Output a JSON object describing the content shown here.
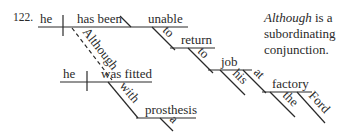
{
  "diagram": {
    "number": "122.",
    "main_clause": {
      "subject": "he",
      "verb": "has been",
      "complement": "unable",
      "infinitive_to_1": "to",
      "infinitive_verb": "return",
      "infinitive_to_2": "to",
      "object": "job",
      "modifier_his": "his",
      "preposition_at": "at",
      "prep_object": "factory",
      "article_the": "the",
      "modifier_ford": "Ford"
    },
    "subordinate_clause": {
      "conjunction": "Although",
      "subject": "he",
      "verb": "was fitted",
      "preposition": "with",
      "prep_object": "prosthesis",
      "article": "a"
    },
    "note": {
      "italic_word": "Although",
      "line1_rest": " is a",
      "line2": "subordinating",
      "line3": "conjunction."
    }
  }
}
